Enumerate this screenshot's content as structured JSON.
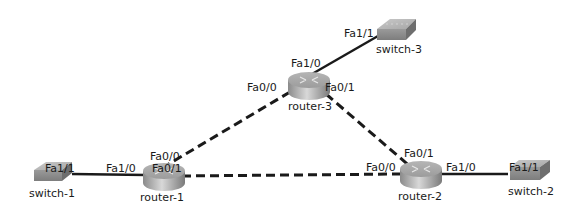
{
  "diagram": {
    "devices": [
      {
        "id": "router-3",
        "type": "router",
        "label": "router-3"
      },
      {
        "id": "router-1",
        "type": "router",
        "label": "router-1"
      },
      {
        "id": "router-2",
        "type": "router",
        "label": "router-2"
      },
      {
        "id": "switch-1",
        "type": "switch",
        "label": "switch-1"
      },
      {
        "id": "switch-2",
        "type": "switch",
        "label": "switch-2"
      },
      {
        "id": "switch-3",
        "type": "switch",
        "label": "switch-3"
      }
    ],
    "links": [
      {
        "from": "router-3",
        "from_port": "Fa1/0",
        "to": "switch-3",
        "to_port": "Fa1/1",
        "style": "solid"
      },
      {
        "from": "router-3",
        "from_port": "Fa0/0",
        "to": "router-1",
        "to_port": "Fa0/0",
        "style": "dashed"
      },
      {
        "from": "router-3",
        "from_port": "Fa0/1",
        "to": "router-2",
        "to_port": "Fa0/1",
        "style": "dashed"
      },
      {
        "from": "router-1",
        "from_port": "Fa0/1",
        "to": "router-2",
        "to_port": "Fa0/0",
        "style": "dashed"
      },
      {
        "from": "router-1",
        "from_port": "Fa1/0",
        "to": "switch-1",
        "to_port": "Fa1/1",
        "style": "solid"
      },
      {
        "from": "router-2",
        "from_port": "Fa1/0",
        "to": "switch-2",
        "to_port": "Fa1/1",
        "style": "solid"
      }
    ],
    "port_labels": {
      "r3_fa10": "Fa1/0",
      "r3_fa00": "Fa0/0",
      "r3_fa01": "Fa0/1",
      "s3_fa11": "Fa1/1",
      "r1_fa00": "Fa0/0",
      "r1_fa01": "Fa0/1",
      "r1_fa10": "Fa1/0",
      "s1_fa11": "Fa1/1",
      "r2_fa01": "Fa0/1",
      "r2_fa00": "Fa0/0",
      "r2_fa10": "Fa1/0",
      "s2_fa11": "Fa1/1"
    }
  }
}
